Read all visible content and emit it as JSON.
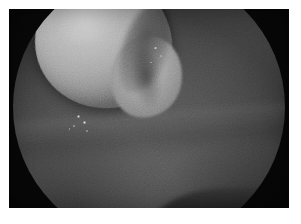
{
  "image": {
    "kind": "endoscopic-photograph",
    "modality": "endoscopy",
    "color_mode": "grayscale",
    "caption": "",
    "alt_text": "Grayscale endoscopic view through a circular scope aperture showing a large smooth rounded pale mass occupying the upper-left of the field, surrounded by darker mucosal wall, with a dark recess to its right and small specular highlights near its lower-left margin.",
    "width_px": 301,
    "height_px": 224
  },
  "plate": {
    "left_px": 9,
    "top_px": 9,
    "width_px": 280,
    "height_px": 199,
    "page_background": "#ffffff",
    "border_background": "#ffffff"
  },
  "palette": {
    "page_white": "#ffffff",
    "surround_dark": "#2a2a2a",
    "corner_black": "#262626",
    "mucosa_mid_gray": "#4a4a4a",
    "mucosa_light_gray": "#5c5c5c",
    "mass_highlight": "#c3c3c3",
    "mass_body": "#b3b3b3",
    "mass_shadow": "#757575",
    "recess_black": "#1f1f1f",
    "specular_white": "#ebebeb"
  },
  "field_of_view": {
    "shape": "circle",
    "center_x_pct": 50,
    "center_y_pct": 49,
    "diameter_px": 272,
    "vignette": "strong"
  },
  "features": [
    {
      "name": "dominant-mass",
      "label": "Smooth rounded pale mass",
      "left_pct": 8,
      "top_pct": 1,
      "width_pct": 50,
      "height_pct": 50,
      "rotation_deg": -12,
      "brightness": "bright"
    },
    {
      "name": "secondary-lobe",
      "label": "Secondary lobe of mass",
      "left_pct": 36,
      "top_pct": 24,
      "width_pct": 26,
      "height_pct": 30,
      "rotation_deg": 10,
      "brightness": "medium-bright"
    },
    {
      "name": "recess-crevice",
      "label": "Dark recess right of mass",
      "left_pct": 40,
      "top_pct": 12,
      "width_pct": 17,
      "height_pct": 34,
      "rotation_deg": 14,
      "brightness": "dark"
    },
    {
      "name": "mucosal-fold",
      "label": "Mucosal fold across lower field",
      "left_pct": -6,
      "top_pct": 52,
      "width_pct": 118,
      "height_pct": 16,
      "rotation_deg": -4,
      "brightness": "medium"
    },
    {
      "name": "bottom-wedge-shadow",
      "label": "Dark wedge at lower aperture edge",
      "left_pct": 50,
      "top_pct": 80,
      "width_pct": 50,
      "height_pct": 26,
      "rotation_deg": 0,
      "brightness": "very-dark"
    }
  ],
  "speculars": [
    {
      "name": "specular-1",
      "left_pct": 23.5,
      "top_pct": 53.0,
      "size_px": 3.2
    },
    {
      "name": "specular-2",
      "left_pct": 25.8,
      "top_pct": 55.4,
      "size_px": 2.6
    },
    {
      "name": "specular-3",
      "left_pct": 22.0,
      "top_pct": 56.8,
      "size_px": 2.2
    },
    {
      "name": "specular-4",
      "left_pct": 27.0,
      "top_pct": 58.6,
      "size_px": 2.0
    },
    {
      "name": "specular-5",
      "left_pct": 52.0,
      "top_pct": 28.0,
      "size_px": 2.4
    },
    {
      "name": "specular-6",
      "left_pct": 54.0,
      "top_pct": 31.0,
      "size_px": 2.0
    },
    {
      "name": "specular-7",
      "left_pct": 50.5,
      "top_pct": 33.5,
      "size_px": 1.8
    },
    {
      "name": "specular-8",
      "left_pct": 20.5,
      "top_pct": 58.0,
      "size_px": 1.6
    }
  ]
}
